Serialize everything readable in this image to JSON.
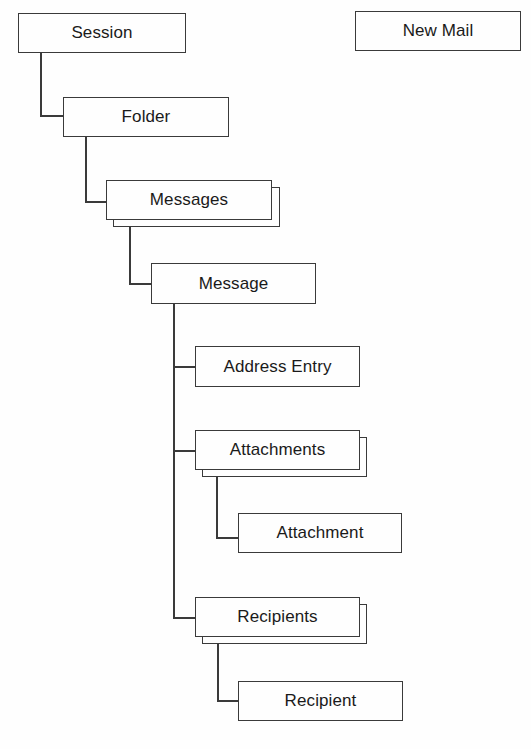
{
  "diagram": {
    "type": "object-hierarchy",
    "nodes": {
      "session": {
        "label": "Session"
      },
      "new_mail": {
        "label": "New Mail"
      },
      "folder": {
        "label": "Folder"
      },
      "messages": {
        "label": "Messages",
        "collection": true
      },
      "message": {
        "label": "Message"
      },
      "address_entry": {
        "label": "Address Entry"
      },
      "attachments": {
        "label": "Attachments",
        "collection": true
      },
      "attachment": {
        "label": "Attachment"
      },
      "recipients": {
        "label": "Recipients",
        "collection": true
      },
      "recipient": {
        "label": "Recipient"
      }
    },
    "edges": [
      [
        "Session",
        "Folder"
      ],
      [
        "Folder",
        "Messages"
      ],
      [
        "Messages",
        "Message"
      ],
      [
        "Message",
        "Address Entry"
      ],
      [
        "Message",
        "Attachments"
      ],
      [
        "Attachments",
        "Attachment"
      ],
      [
        "Message",
        "Recipients"
      ],
      [
        "Recipients",
        "Recipient"
      ]
    ],
    "colors": {
      "line": "#3a3a3a",
      "background": "#fefefe",
      "text": "#1a1a1a"
    }
  }
}
